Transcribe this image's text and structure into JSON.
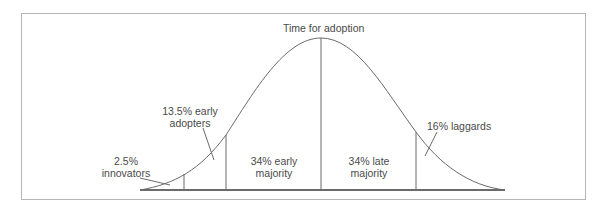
{
  "diagram": {
    "title": "Time for adoption",
    "segments": [
      {
        "label_line1": "2.5%",
        "label_line2": "innovators",
        "percent": 2.5
      },
      {
        "label_line1": "13.5% early",
        "label_line2": "adopters",
        "percent": 13.5
      },
      {
        "label_line1": "34% early",
        "label_line2": "majority",
        "percent": 34
      },
      {
        "label_line1": "34% late",
        "label_line2": "majority",
        "percent": 34
      },
      {
        "label_line1": "16% laggards",
        "label_line2": "",
        "percent": 16
      }
    ],
    "colors": {
      "curve": "#6a6a6a",
      "frame": "#b5b5b5",
      "baseline": "#3a3a3a",
      "text": "#4a4a4a"
    }
  }
}
